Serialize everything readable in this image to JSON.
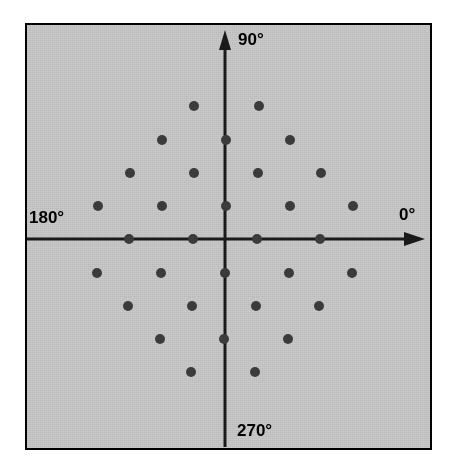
{
  "figure": {
    "name": "polar-angle-lattice-diagram",
    "panel": {
      "background_color": "#c9c9c9",
      "border_color": "#000000",
      "x": 25,
      "y": 23,
      "width": 407,
      "height": 427
    }
  },
  "axes": {
    "origin": {
      "x": 225,
      "y": 239
    },
    "color": "#1a1a1a",
    "vertical": {
      "x": 225,
      "y_top": 33,
      "y_bottom": 447,
      "arrow_at": "top"
    },
    "horizontal": {
      "y": 239,
      "x_left": 27,
      "x_right": 424,
      "arrow_at": "right"
    },
    "labels": [
      {
        "id": "label-90",
        "text": "90°",
        "x": 238,
        "y": 30,
        "anchor": "top-of-vertical-axis"
      },
      {
        "id": "label-0",
        "text": "0°",
        "x": 399,
        "y": 205,
        "anchor": "right-of-horizontal-axis"
      },
      {
        "id": "label-180",
        "text": "180°",
        "x": 29,
        "y": 208,
        "anchor": "left-of-horizontal-axis"
      },
      {
        "id": "label-270",
        "text": "270°",
        "x": 237,
        "y": 421,
        "anchor": "bottom-of-vertical-axis"
      }
    ]
  },
  "chart_data": {
    "type": "scatter",
    "title": "",
    "subtitle": "",
    "xlabel": "",
    "ylabel": "",
    "grid": false,
    "legend": null,
    "annotations": [
      {
        "text": "90°",
        "position": "top"
      },
      {
        "text": "0°",
        "position": "right"
      },
      {
        "text": "180°",
        "position": "left"
      },
      {
        "text": "270°",
        "position": "bottom"
      }
    ],
    "axis_angles_deg": [
      0,
      90,
      180,
      270
    ],
    "marker": {
      "shape": "circle",
      "radius_px": 5,
      "color": "#3b3b3b"
    },
    "lattice": {
      "description": "triangular (hexagonal) lattice of points centred on the polar origin",
      "column_spacing_px": 32,
      "row_spacing_px": 33,
      "rows_y": [
        106,
        140,
        173,
        206,
        239,
        273,
        306,
        339,
        372
      ],
      "count": 41
    },
    "points_px": [
      {
        "x": 194,
        "y": 106
      },
      {
        "x": 259,
        "y": 106
      },
      {
        "x": 162,
        "y": 140
      },
      {
        "x": 226,
        "y": 140
      },
      {
        "x": 290,
        "y": 140
      },
      {
        "x": 130,
        "y": 173
      },
      {
        "x": 194,
        "y": 173
      },
      {
        "x": 258,
        "y": 173
      },
      {
        "x": 321,
        "y": 173
      },
      {
        "x": 98,
        "y": 206
      },
      {
        "x": 162,
        "y": 206
      },
      {
        "x": 226,
        "y": 206
      },
      {
        "x": 290,
        "y": 206
      },
      {
        "x": 353,
        "y": 206
      },
      {
        "x": 129,
        "y": 239
      },
      {
        "x": 193,
        "y": 239
      },
      {
        "x": 257,
        "y": 239
      },
      {
        "x": 320,
        "y": 239
      },
      {
        "x": 97,
        "y": 273
      },
      {
        "x": 161,
        "y": 273
      },
      {
        "x": 225,
        "y": 273
      },
      {
        "x": 289,
        "y": 273
      },
      {
        "x": 352,
        "y": 273
      },
      {
        "x": 128,
        "y": 306
      },
      {
        "x": 192,
        "y": 306
      },
      {
        "x": 256,
        "y": 306
      },
      {
        "x": 319,
        "y": 306
      },
      {
        "x": 160,
        "y": 339
      },
      {
        "x": 224,
        "y": 339
      },
      {
        "x": 288,
        "y": 339
      },
      {
        "x": 191,
        "y": 372
      },
      {
        "x": 255,
        "y": 372
      }
    ],
    "points_polar": [
      {
        "r": 69,
        "theta_deg": 180
      },
      {
        "r": 69,
        "theta_deg": 0
      },
      {
        "r": 34,
        "theta_deg": 180
      },
      {
        "r": 34,
        "theta_deg": 0
      },
      {
        "r": 33,
        "theta_deg": 90
      },
      {
        "r": 34,
        "theta_deg": 270
      },
      {
        "r": 66,
        "theta_deg": 90
      },
      {
        "r": 66,
        "theta_deg": 270
      },
      {
        "r": 100,
        "theta_deg": 90
      },
      {
        "r": 100,
        "theta_deg": 270
      },
      {
        "r": 127,
        "theta_deg": 180
      },
      {
        "r": 128,
        "theta_deg": 0
      }
    ]
  }
}
